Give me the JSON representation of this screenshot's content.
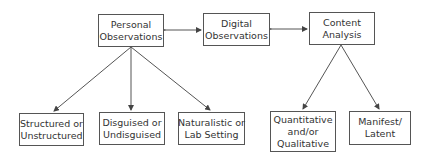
{
  "diagram": {
    "top_nodes": [
      {
        "id": "personal",
        "lines": [
          "Personal",
          "Observations"
        ]
      },
      {
        "id": "digital",
        "lines": [
          "Digital",
          "Observations"
        ]
      },
      {
        "id": "content",
        "lines": [
          "Content",
          "Analysis"
        ]
      }
    ],
    "personal_children": [
      {
        "id": "structured",
        "lines": [
          "Structured or",
          "Unstructured"
        ]
      },
      {
        "id": "disguised",
        "lines": [
          "Disguised or",
          "Undisguised"
        ]
      },
      {
        "id": "naturalistic",
        "lines": [
          "Naturalistic or",
          "Lab Setting"
        ]
      }
    ],
    "content_children": [
      {
        "id": "quantitative",
        "lines": [
          "Quantitative",
          "and/or",
          "Qualitative"
        ]
      },
      {
        "id": "manifest",
        "lines": [
          "Manifest/",
          "Latent"
        ]
      }
    ],
    "edges": [
      {
        "from": "personal",
        "to": "digital",
        "type": "bidirectional"
      },
      {
        "from": "digital",
        "to": "content",
        "type": "bidirectional"
      },
      {
        "from": "personal",
        "to": "structured",
        "type": "arrow"
      },
      {
        "from": "personal",
        "to": "disguised",
        "type": "arrow"
      },
      {
        "from": "personal",
        "to": "naturalistic",
        "type": "arrow"
      },
      {
        "from": "content",
        "to": "quantitative",
        "type": "arrow"
      },
      {
        "from": "content",
        "to": "manifest",
        "type": "arrow"
      }
    ],
    "colors": {
      "stroke": "#555555",
      "text": "#333333",
      "background": "#ffffff"
    }
  }
}
